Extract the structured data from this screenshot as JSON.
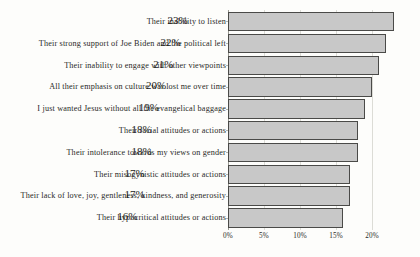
{
  "chart_data": {
    "type": "bar",
    "orientation": "horizontal",
    "title": "",
    "xlabel": "",
    "ylabel": "",
    "xlim": [
      0,
      25
    ],
    "grid": true,
    "legend": null,
    "xticks": [
      "0%",
      "5%",
      "10%",
      "15%",
      "20%"
    ],
    "xtick_values": [
      0,
      5,
      10,
      15,
      20
    ],
    "categories": [
      "Their inability to listen",
      "Their strong support of Joe Biden and the political left",
      "Their inability to engage with other viewpoints",
      "All their emphasis on culture war lost me over time",
      "I just wanted Jesus without all the evangelical baggage",
      "Their racial attitudes or actions",
      "Their intolerance towards my views on gender",
      "Their misogynistic attitudes or actions",
      "Their lack of love, joy, gentleness, kindness, and generosity",
      "Their hypocritical attitudes or actions"
    ],
    "values": [
      23,
      22,
      21,
      20,
      19,
      18,
      18,
      17,
      17,
      16
    ],
    "data_labels": [
      "23%",
      "22%",
      "21%",
      "20%",
      "19%",
      "18%",
      "18%",
      "17%",
      "17%",
      "16%"
    ],
    "colors": {
      "bar_fill": "#c8c8c8",
      "bar_border": "#4a4a48",
      "gridline": "#dcdcd6",
      "axis": "#9a9a93",
      "text": "#2a2a28",
      "background": "#fdfdfb"
    }
  }
}
